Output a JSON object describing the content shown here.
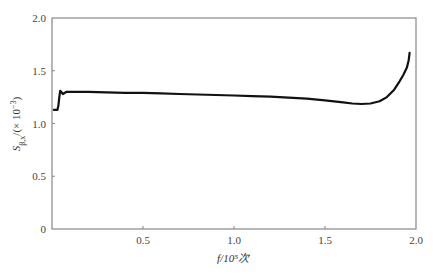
{
  "chart_data": {
    "type": "line",
    "title": "",
    "xlabel": "f/10⁵次",
    "ylabel": "S_{β,x}/(×10⁻³)",
    "xlim": [
      0,
      2.0
    ],
    "ylim": [
      0,
      2.0
    ],
    "x_ticks": [
      0.5,
      1.0,
      1.5,
      2.0
    ],
    "x_tick_labels": [
      "0.5",
      "1.0",
      "1.5",
      "2.0"
    ],
    "y_ticks": [
      0,
      0.5,
      1.0,
      1.5,
      2.0
    ],
    "y_tick_labels": [
      "0",
      "0.5",
      "1.0",
      "1.5",
      "2.0"
    ],
    "grid": false,
    "legend": null,
    "series": [
      {
        "name": "S",
        "color": "#111111",
        "x": [
          0.01,
          0.03,
          0.035,
          0.04,
          0.045,
          0.05,
          0.06,
          0.08,
          0.1,
          0.2,
          0.3,
          0.4,
          0.5,
          0.6,
          0.7,
          0.8,
          0.9,
          1.0,
          1.1,
          1.2,
          1.3,
          1.4,
          1.5,
          1.6,
          1.65,
          1.7,
          1.75,
          1.8,
          1.84,
          1.88,
          1.91,
          1.93,
          1.95,
          1.96,
          1.965
        ],
        "y": [
          1.13,
          1.13,
          1.17,
          1.25,
          1.31,
          1.3,
          1.28,
          1.3,
          1.3,
          1.3,
          1.295,
          1.29,
          1.29,
          1.285,
          1.28,
          1.275,
          1.27,
          1.265,
          1.26,
          1.255,
          1.245,
          1.235,
          1.22,
          1.2,
          1.19,
          1.185,
          1.19,
          1.21,
          1.25,
          1.32,
          1.4,
          1.46,
          1.53,
          1.6,
          1.67
        ]
      }
    ]
  }
}
